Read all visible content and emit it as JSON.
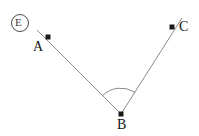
{
  "figure": {
    "background_color": "#ffffff",
    "line_color": "#8a8a8a",
    "dot_color": "#1a1a1a",
    "label_color": "#111111",
    "width": 199,
    "height": 136
  },
  "badge": {
    "label": "E",
    "shape": "circle",
    "center_x": 20,
    "center_y": 23,
    "radius": 8.5,
    "stroke_color": "#4a4a4a"
  },
  "points": [
    {
      "name": "A",
      "label": "A",
      "x": 48,
      "y": 37
    },
    {
      "name": "B",
      "label": "B",
      "x": 121,
      "y": 114
    },
    {
      "name": "C",
      "label": "C",
      "x": 172,
      "y": 27
    }
  ],
  "rays": [
    {
      "name": "ray-ba",
      "from": "B",
      "through": "A",
      "x1": 121,
      "y1": 114,
      "x2": 37,
      "y2": 30
    },
    {
      "name": "ray-bc",
      "from": "B",
      "through": "C",
      "x1": 121,
      "y1": 114,
      "x2": 182,
      "y2": 18
    }
  ],
  "angle_arc": {
    "vertex": "B",
    "radius": 26,
    "path": "M 102.6 95.6 A 26 26 0 0 1 134.8 92.2"
  },
  "chart_data": {
    "type": "scatter",
    "xlabel": "",
    "ylabel": "",
    "categories": [
      "A",
      "B",
      "C"
    ],
    "x": [
      48,
      121,
      172
    ],
    "y": [
      37,
      114,
      27
    ],
    "series": [
      {
        "name": "points",
        "values": [
          37,
          114,
          27
        ]
      }
    ],
    "annotations": [
      "A",
      "B",
      "C",
      "E"
    ],
    "grid": false,
    "legend": "none"
  }
}
